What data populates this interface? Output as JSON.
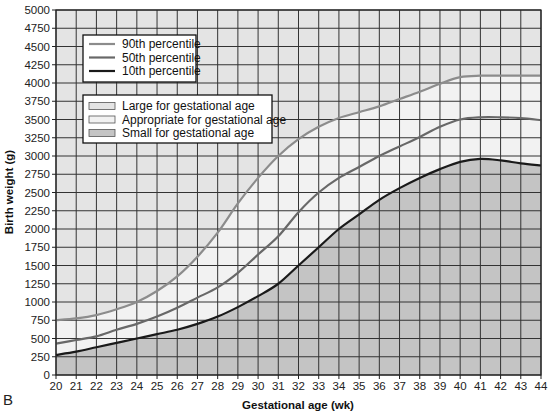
{
  "panel_label": "B",
  "colors": {
    "lga_fill": "#e4e4e4",
    "aga_fill": "#f2f2f2",
    "sga_fill": "#c4c4c4",
    "grid": "#333333",
    "p90": "#8c8c8c",
    "p50": "#686868",
    "p10": "#1a1a1a"
  },
  "legend_lines": [
    {
      "label": "90th percentile",
      "key": "p90"
    },
    {
      "label": "50th percentile",
      "key": "p50"
    },
    {
      "label": "10th percentile",
      "key": "p10"
    }
  ],
  "legend_areas": [
    {
      "label": "Large for gestational age",
      "key": "lga_fill"
    },
    {
      "label": "Appropriate for gestational age",
      "key": "aga_fill"
    },
    {
      "label": "Small for gestational age",
      "key": "sga_fill"
    }
  ],
  "chart_data": {
    "type": "line",
    "title": "",
    "xlabel": "Gestational age (wk)",
    "ylabel": "Birth weight (g)",
    "xlim": [
      20,
      44
    ],
    "ylim": [
      0,
      5000
    ],
    "x_ticks": [
      20,
      21,
      22,
      23,
      24,
      25,
      26,
      27,
      28,
      29,
      30,
      31,
      32,
      33,
      34,
      35,
      36,
      37,
      38,
      39,
      40,
      41,
      42,
      43,
      44
    ],
    "y_ticks": [
      0,
      250,
      500,
      750,
      1000,
      1250,
      1500,
      1750,
      2000,
      2250,
      2500,
      2750,
      3000,
      3250,
      3500,
      3750,
      4000,
      4250,
      4500,
      4750,
      5000
    ],
    "grid": true,
    "legend_position": "upper left",
    "x": [
      20,
      21,
      22,
      23,
      24,
      25,
      26,
      27,
      28,
      29,
      30,
      31,
      32,
      33,
      34,
      35,
      36,
      37,
      38,
      39,
      40,
      41,
      42,
      43,
      44
    ],
    "series": [
      {
        "name": "90th percentile",
        "values": [
          750,
          775,
          820,
          900,
          1000,
          1150,
          1350,
          1620,
          1950,
          2350,
          2700,
          3000,
          3230,
          3400,
          3520,
          3600,
          3680,
          3780,
          3880,
          3990,
          4080,
          4100,
          4100,
          4100,
          4100
        ]
      },
      {
        "name": "50th percentile",
        "values": [
          430,
          480,
          530,
          620,
          700,
          800,
          920,
          1060,
          1200,
          1400,
          1650,
          1900,
          2230,
          2500,
          2700,
          2850,
          3000,
          3130,
          3260,
          3400,
          3500,
          3530,
          3530,
          3520,
          3490
        ]
      },
      {
        "name": "10th percentile",
        "values": [
          275,
          320,
          380,
          440,
          500,
          560,
          620,
          700,
          800,
          930,
          1080,
          1250,
          1500,
          1750,
          2000,
          2200,
          2400,
          2560,
          2700,
          2820,
          2920,
          2960,
          2940,
          2900,
          2870
        ]
      }
    ],
    "regions": [
      {
        "name": "Large for gestational age",
        "bounds": "above 90th percentile"
      },
      {
        "name": "Appropriate for gestational age",
        "bounds": "between 10th and 90th percentile"
      },
      {
        "name": "Small for gestational age",
        "bounds": "below 10th percentile"
      }
    ]
  }
}
